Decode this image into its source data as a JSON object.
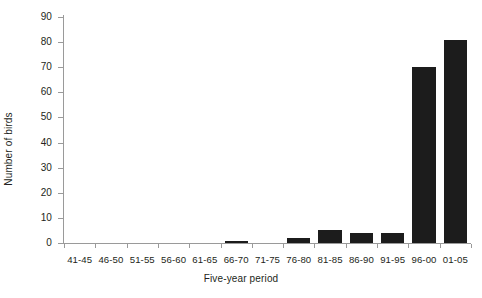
{
  "chart_data": {
    "type": "bar",
    "title": "",
    "xlabel": "Five-year period",
    "ylabel": "Number of birds",
    "categories": [
      "41-45",
      "46-50",
      "51-55",
      "56-60",
      "61-65",
      "66-70",
      "71-75",
      "76-80",
      "81-85",
      "86-90",
      "91-95",
      "96-00",
      "01-05"
    ],
    "values": [
      0,
      0,
      0,
      0,
      0,
      1,
      0,
      2,
      5,
      4,
      4,
      70,
      81
    ],
    "ylim": [
      0,
      90
    ],
    "yticks": [
      0,
      10,
      20,
      30,
      40,
      50,
      60,
      70,
      80,
      90
    ],
    "ytick_labels": [
      "0",
      "10",
      "20",
      "30",
      "40",
      "50",
      "60",
      "70",
      "80",
      "90"
    ],
    "grid": false,
    "legend": null,
    "bar_color": "#1c1c1c",
    "axis_color": "#9a9a9a",
    "background": "#ffffff"
  }
}
